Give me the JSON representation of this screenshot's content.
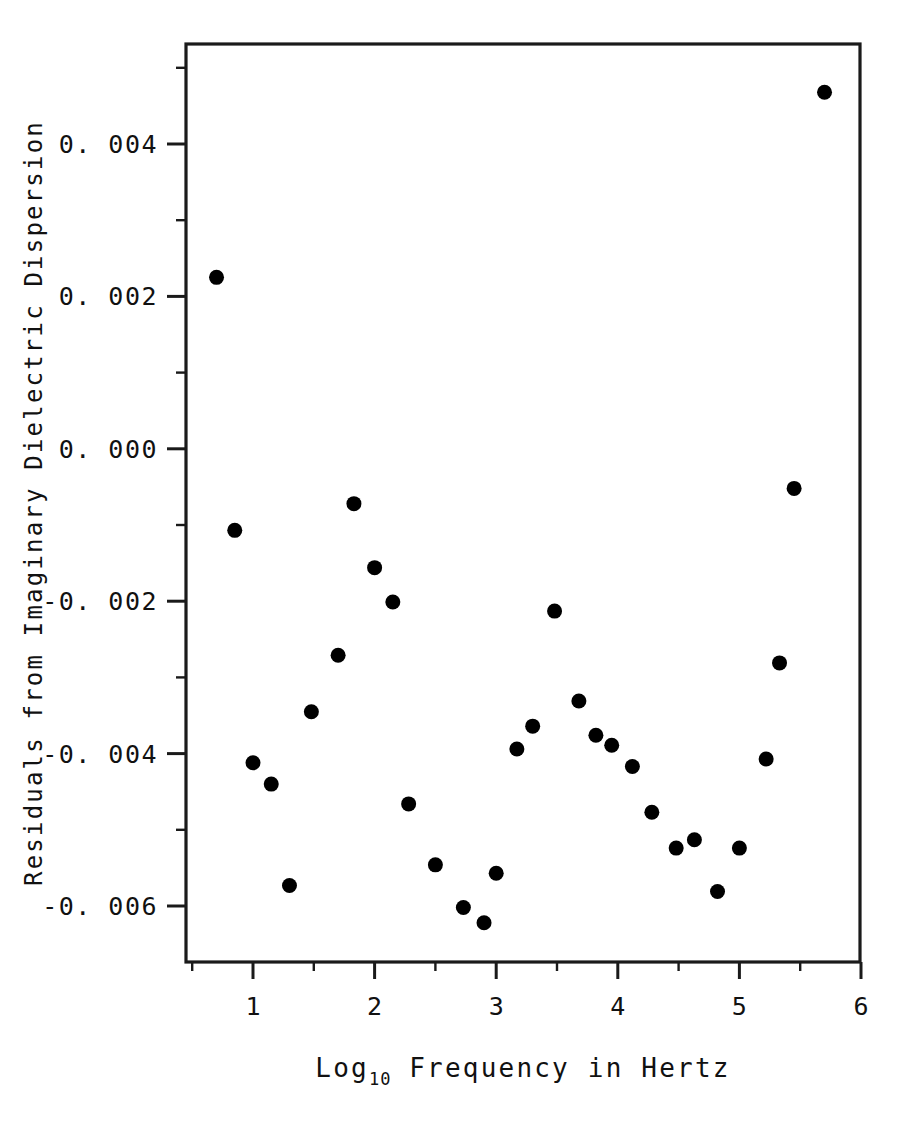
{
  "chart_data": {
    "type": "scatter",
    "title": "",
    "xlabel": "Log10 Frequency in Hertz",
    "xlabel_base": "Log",
    "xlabel_sub": "10",
    "xlabel_rest": "Frequency in Hertz",
    "ylabel": "Residuals from Imaginary Dielectric Dispersion",
    "xlim": [
      0.5,
      6.0
    ],
    "ylim": [
      -0.0068,
      0.0055
    ],
    "grid": false,
    "legend": null,
    "marker": "filled-circle",
    "marker_color": "#000000",
    "xticks": [
      1,
      2,
      3,
      4,
      5,
      6
    ],
    "xticklabels": [
      "1",
      "2",
      "3",
      "4",
      "5",
      "6"
    ],
    "xminor_ticks": [
      0.5,
      1.5,
      2.5,
      3.5,
      4.5,
      5.5
    ],
    "yticks": [
      0.004,
      0.002,
      0.0,
      -0.002,
      -0.004,
      -0.006
    ],
    "yticklabels": [
      "0. 004",
      "0. 002",
      "0. 000",
      "-0. 002",
      "-0. 004",
      "-0. 006"
    ],
    "yminor_ticks": [
      0.005,
      0.003,
      0.001,
      -0.001,
      -0.003,
      -0.005
    ],
    "x": [
      0.7,
      0.85,
      1.0,
      1.15,
      1.3,
      1.48,
      1.7,
      1.83,
      2.0,
      2.15,
      2.28,
      2.5,
      2.73,
      2.9,
      3.0,
      3.17,
      3.3,
      3.48,
      3.68,
      3.82,
      3.95,
      4.12,
      4.28,
      4.48,
      4.63,
      4.82,
      5.0,
      5.22,
      5.33,
      5.45,
      5.7
    ],
    "y": [
      0.00225,
      -0.00107,
      -0.00412,
      -0.0044,
      -0.00573,
      -0.00345,
      -0.00271,
      -0.00072,
      -0.00156,
      -0.00201,
      -0.00466,
      -0.00546,
      -0.00602,
      -0.00622,
      -0.00557,
      -0.00394,
      -0.00364,
      -0.00213,
      -0.00331,
      -0.00376,
      -0.00389,
      -0.00417,
      -0.00477,
      -0.00524,
      -0.00513,
      -0.00581,
      -0.00524,
      -0.00407,
      -0.00281,
      -0.00052,
      0.00468
    ],
    "points": [
      {
        "x": 0.7,
        "y": 0.00225
      },
      {
        "x": 0.85,
        "y": -0.00107
      },
      {
        "x": 1.0,
        "y": -0.00412
      },
      {
        "x": 1.15,
        "y": -0.0044
      },
      {
        "x": 1.3,
        "y": -0.00573
      },
      {
        "x": 1.48,
        "y": -0.00345
      },
      {
        "x": 1.7,
        "y": -0.00271
      },
      {
        "x": 1.83,
        "y": -0.00072
      },
      {
        "x": 2.0,
        "y": -0.00156
      },
      {
        "x": 2.15,
        "y": -0.00201
      },
      {
        "x": 2.28,
        "y": -0.00466
      },
      {
        "x": 2.5,
        "y": -0.00546
      },
      {
        "x": 2.73,
        "y": -0.00602
      },
      {
        "x": 2.9,
        "y": -0.00622
      },
      {
        "x": 3.0,
        "y": -0.00557
      },
      {
        "x": 3.17,
        "y": -0.00394
      },
      {
        "x": 3.3,
        "y": -0.00364
      },
      {
        "x": 3.48,
        "y": -0.00213
      },
      {
        "x": 3.68,
        "y": -0.00331
      },
      {
        "x": 3.82,
        "y": -0.00376
      },
      {
        "x": 3.95,
        "y": -0.00389
      },
      {
        "x": 4.12,
        "y": -0.00417
      },
      {
        "x": 4.28,
        "y": -0.00477
      },
      {
        "x": 4.48,
        "y": -0.00524
      },
      {
        "x": 4.63,
        "y": -0.00513
      },
      {
        "x": 4.82,
        "y": -0.00581
      },
      {
        "x": 5.0,
        "y": -0.00524
      },
      {
        "x": 5.22,
        "y": -0.00407
      },
      {
        "x": 5.33,
        "y": -0.00281
      },
      {
        "x": 5.45,
        "y": -0.00052
      },
      {
        "x": 5.7,
        "y": 0.00468
      }
    ]
  },
  "style": {
    "background": "#ffffff",
    "axis_color": "#1a1a1a",
    "text_color": "#111111",
    "marker_radius": 7.5
  },
  "geometry": {
    "plot_left": 186,
    "plot_right": 860,
    "plot_top": 44,
    "plot_bottom": 962,
    "x_at_1": 253,
    "x_per_unit": 121.6,
    "y_at_0004": 144,
    "px_per_0001": 76.2
  }
}
